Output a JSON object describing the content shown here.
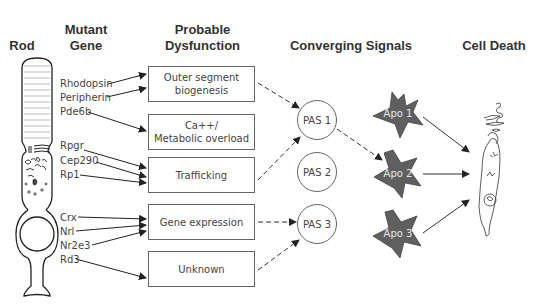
{
  "headers": {
    "rod": "Rod",
    "mutant_gene": [
      "Mutant",
      "Gene"
    ],
    "probable_dysfunction": [
      "Probable",
      "Dysfunction"
    ],
    "converging_signals": "Converging Signals",
    "cell_death": "Cell Death"
  },
  "genes": [
    {
      "label": "Rhodopsin",
      "target": "Outer segment biogenesis"
    },
    {
      "label": "Peripherin",
      "target": "Outer segment biogenesis"
    },
    {
      "label": "Pde6b",
      "target": "Ca++/Metabolic overload"
    },
    {
      "label": "Rpgr",
      "target": "Trafficking"
    },
    {
      "label": "Cep290",
      "target": "Trafficking"
    },
    {
      "label": "Rp1",
      "target": "Trafficking"
    },
    {
      "label": "Crx",
      "target": "Gene expression"
    },
    {
      "label": "Nrl",
      "target": "Gene expression"
    },
    {
      "label": "Nr2e3",
      "target": "Gene expression"
    },
    {
      "label": "Rd3",
      "target": "Unknown"
    }
  ],
  "dysfunctions": [
    {
      "line1": "Outer segment",
      "line2": "biogenesis"
    },
    {
      "line1": "Ca++/",
      "line2": "Metabolic overload"
    },
    {
      "line1": "Trafficking",
      "line2": ""
    },
    {
      "line1": "Gene expression",
      "line2": ""
    },
    {
      "line1": "Unknown",
      "line2": ""
    }
  ],
  "signals": [
    {
      "label": "PAS 1"
    },
    {
      "label": "PAS 2"
    },
    {
      "label": "PAS 3"
    }
  ],
  "apoptosis": [
    {
      "label": "Apo 1"
    },
    {
      "label": "Apo 2"
    },
    {
      "label": "Apo 3"
    }
  ],
  "colors": {
    "text": "#333333",
    "box_border": "#666666",
    "star_fill": "#5f5f5f",
    "star_label": "#e8e8e8",
    "line": "#333333"
  }
}
